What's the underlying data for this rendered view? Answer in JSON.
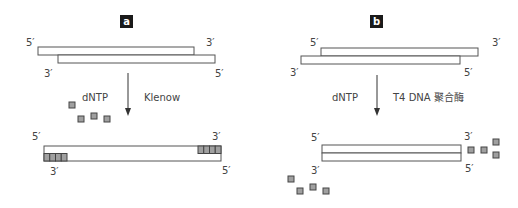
{
  "panels": [
    {
      "id": "a",
      "badge": "a",
      "substrate": {
        "top_strand": {
          "left_end": "5′",
          "right_end": "3′"
        },
        "bottom_strand": {
          "left_end": "3′",
          "right_end": "5′"
        },
        "description": "5′ overhang on both ends (recessed 3′ ends)"
      },
      "reagent_left": "dNTP",
      "reagent_right": "Klenow",
      "product": {
        "top_strand": {
          "left_end": "5′",
          "right_end": "3′"
        },
        "bottom_strand": {
          "left_end": "3′",
          "right_end": "5′"
        },
        "filled_nucleotides_left": 4,
        "filled_nucleotides_right": 4,
        "description": "Fill-in: recessed 3′ ends extended to blunt ends"
      },
      "free_dntp_count": 4
    },
    {
      "id": "b",
      "badge": "b",
      "substrate": {
        "top_strand": {
          "left_end": "5′",
          "right_end": "3′"
        },
        "bottom_strand": {
          "left_end": "3′",
          "right_end": "5′"
        },
        "description": "3′ overhang on both ends"
      },
      "reagent_left": "dNTP",
      "reagent_right": "T4 DNA 聚合酶",
      "product": {
        "top_strand": {
          "left_end": "5′",
          "right_end": "3′"
        },
        "bottom_strand": {
          "left_end": "3′",
          "right_end": "5′"
        },
        "description": "3′ overhangs removed (exonuclease), blunt ends"
      },
      "released_nucleotides_right": 4,
      "released_nucleotides_left": 4
    }
  ],
  "colors": {
    "strand_stroke": "#555555",
    "nucleotide_fill": "#a0a0a0",
    "nucleotide_stroke": "#444444",
    "badge_bg": "#1a1a1a",
    "arrow": "#333333"
  }
}
